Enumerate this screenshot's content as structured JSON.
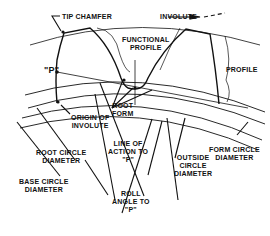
{
  "diagram": {
    "labels": {
      "tip_chamfer": "TIP CHAMFER",
      "involute": "INVOLUTE",
      "functional_profile_1": "FUNCTIONAL",
      "functional_profile_2": "PROFILE",
      "profile": "PROFILE",
      "point_p": "\"P\"",
      "root_form_1": "ROOT",
      "root_form_2": "FORM",
      "origin_of_involute_1": "ORIGIN OF",
      "origin_of_involute_2": "INVOLUTE",
      "root_circle_1": "ROOT CIRCLE",
      "root_circle_2": "DIAMETER",
      "line_of_action_1": "LINE OF",
      "line_of_action_2": "ACTION TO",
      "line_of_action_3": "\"P\"",
      "outside_circle_1": "OUTSIDE",
      "outside_circle_2": "CIRCLE",
      "outside_circle_3": "DIAMETER",
      "form_circle_1": "FORM CIRCLE",
      "form_circle_2": "DIAMETER",
      "base_circle_1": "BASE CIRCLE",
      "base_circle_2": "DIAMETER",
      "roll_angle_1": "ROLL",
      "roll_angle_2": "ANGLE TO",
      "roll_angle_3": "\"P\""
    }
  }
}
